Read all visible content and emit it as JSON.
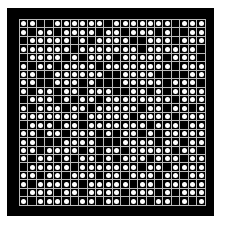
{
  "board": {
    "cols": 22,
    "rows_count": 22,
    "colors": {
      "frame": "#000000",
      "grid": "#bbbbbb",
      "dot": "#ffffff",
      "cell": "#000000"
    },
    "rows": [
      "1100111111011111110111",
      "1011011110110111010011",
      "0111110101111001110111",
      "1111110111111101111110",
      "0111101011101111101110",
      "1011011110111111110111",
      "1100111111001111000011",
      "1100111010001111101110",
      "1011011011100110101111",
      "0111010110111111110111",
      "1011101101111101101101",
      "1111111011111011110111",
      "0111011011111110111011",
      "1101101110101101011111",
      "1100011110001111011011",
      "1101111010110111110110",
      "1011010110101110111011",
      "0111110111111101101111",
      "1101101110110111011011",
      "1011111011111011011111",
      "0111011011110111010111",
      "1011110110110110110101"
    ]
  }
}
